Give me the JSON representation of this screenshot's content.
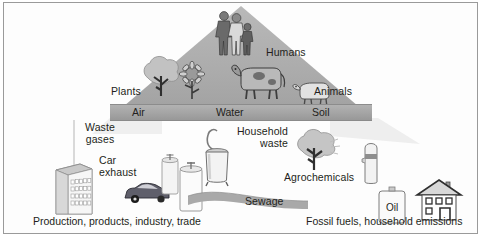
{
  "figure": {
    "type": "pyramid-exposure-diagram",
    "background": "#ffffff",
    "border_color": "#9a9a9a"
  },
  "pyramid": {
    "apex_label": "Humans",
    "tier_labels": [
      {
        "label": "Plants"
      },
      {
        "label": "Animals"
      }
    ],
    "compartment_band": {
      "fill": "#a4a4a4",
      "items": [
        {
          "label": "Air"
        },
        {
          "label": "Water"
        },
        {
          "label": "Soil"
        }
      ]
    }
  },
  "sources": {
    "waste_gases": "Waste\ngases",
    "car_exhaust": "Car\nexhaust",
    "household_waste": "Household\nwaste",
    "agrochemicals": "Agrochemicals",
    "sewage": "Sewage",
    "oil": "Oil"
  },
  "captions": {
    "left": "Production, products, industry, trade",
    "right": "Fossil fuels, household emissions"
  },
  "icons": {
    "humans": "family-icon",
    "tree": "tree-icon",
    "sunflower": "sunflower-icon",
    "cow": "cow-icon",
    "pig": "pig-icon",
    "factory": "factory-building-icon",
    "car": "car-icon",
    "tank_small": "storage-tank-icon",
    "tank_large": "storage-tank-icon",
    "bin": "pedal-bin-icon",
    "sprayed_tree": "sprayed-tree-icon",
    "spray_can": "spray-canister-icon",
    "oil_can": "oil-can-icon",
    "house": "house-icon",
    "sewage_stream": "sewage-stream-icon"
  }
}
